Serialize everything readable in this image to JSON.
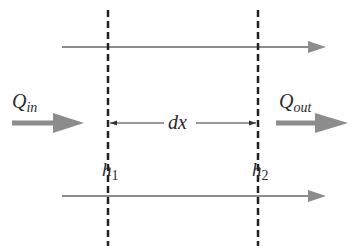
{
  "diagram": {
    "labels": {
      "q_in": "Q",
      "q_in_sub": "in",
      "q_out": "Q",
      "q_out_sub": "out",
      "dx": "dx",
      "h1": "h",
      "h1_sub": "1",
      "h2": "h",
      "h2_sub": "2"
    },
    "colors": {
      "flow_arrow": "#8c8c8c",
      "dashed_line": "#222222",
      "dimension_line": "#333333",
      "text": "#2a2a2a"
    }
  }
}
